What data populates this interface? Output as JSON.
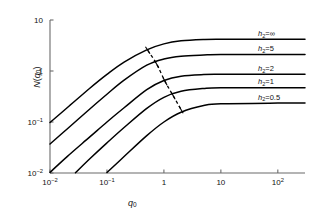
{
  "axes": {
    "x": {
      "label": "q0",
      "label_base": "q",
      "label_sub": "0",
      "ticks": [
        {
          "value": 0.01,
          "text_base": "10",
          "text_sup": "-2"
        },
        {
          "value": 0.1,
          "text_base": "10",
          "text_sup": "-1"
        },
        {
          "value": 1,
          "text_base": "1",
          "text_sup": ""
        },
        {
          "value": 10,
          "text_base": "10",
          "text_sup": ""
        },
        {
          "value": 100,
          "text_base": "10",
          "text_sup": "2"
        }
      ],
      "min": 0.01,
      "max": 300,
      "scale": "log"
    },
    "y": {
      "label_base": "N",
      "label_paren_open": "(",
      "label_q": "q",
      "label_sub": "0",
      "label_paren_close": ")",
      "ticks": [
        {
          "value": 0.01,
          "text_base": "10",
          "text_sup": "-2"
        },
        {
          "value": 0.1,
          "text_base": "10",
          "text_sup": "-1"
        },
        {
          "value": 1,
          "text_base": "1",
          "text_sup": ""
        },
        {
          "value": 10,
          "text_base": "10",
          "text_sup": ""
        }
      ],
      "min": 0.01,
      "max": 10,
      "scale": "log"
    }
  },
  "chart_data": {
    "type": "line",
    "title": "",
    "xlabel": "q0",
    "ylabel": "N(q0)",
    "xlim": [
      0.01,
      300
    ],
    "ylim": [
      0.01,
      10
    ],
    "xscale": "log",
    "yscale": "log",
    "grid": false,
    "legend_position": "inline-right",
    "annotation": {
      "name": "dashed-locus",
      "style": "dashed",
      "description": "dashed curve crossing the family of curves, with short tick marks at each crossing",
      "points": [
        {
          "x": 0.52,
          "y": 2.55
        },
        {
          "x": 0.75,
          "y": 1.35
        },
        {
          "x": 1.05,
          "y": 0.62
        },
        {
          "x": 1.45,
          "y": 0.33
        },
        {
          "x": 2.0,
          "y": 0.175
        }
      ]
    },
    "series": [
      {
        "name": "h2=inf",
        "label_base": "h",
        "label_sub": "2",
        "label_eq": "=",
        "label_value": "∞",
        "plateau": 4.2,
        "x_start": 0.01,
        "y_start": 0.098,
        "points": [
          {
            "x": 0.01,
            "y": 0.098
          },
          {
            "x": 0.02,
            "y": 0.19
          },
          {
            "x": 0.05,
            "y": 0.46
          },
          {
            "x": 0.1,
            "y": 0.86
          },
          {
            "x": 0.2,
            "y": 1.5
          },
          {
            "x": 0.5,
            "y": 2.6
          },
          {
            "x": 1,
            "y": 3.4
          },
          {
            "x": 2,
            "y": 3.9
          },
          {
            "x": 5,
            "y": 4.15
          },
          {
            "x": 10,
            "y": 4.2
          },
          {
            "x": 100,
            "y": 4.2
          },
          {
            "x": 300,
            "y": 4.2
          }
        ]
      },
      {
        "name": "h2=5",
        "label_base": "h",
        "label_sub": "2",
        "label_eq": "=",
        "label_value": "5",
        "plateau": 2.1,
        "x_start": 0.01,
        "y_start": 0.037,
        "points": [
          {
            "x": 0.01,
            "y": 0.037
          },
          {
            "x": 0.02,
            "y": 0.073
          },
          {
            "x": 0.05,
            "y": 0.18
          },
          {
            "x": 0.1,
            "y": 0.35
          },
          {
            "x": 0.2,
            "y": 0.66
          },
          {
            "x": 0.5,
            "y": 1.3
          },
          {
            "x": 1,
            "y": 1.72
          },
          {
            "x": 2,
            "y": 1.95
          },
          {
            "x": 5,
            "y": 2.06
          },
          {
            "x": 10,
            "y": 2.1
          },
          {
            "x": 100,
            "y": 2.1
          },
          {
            "x": 300,
            "y": 2.1
          }
        ]
      },
      {
        "name": "h2=2",
        "label_base": "h",
        "label_sub": "2",
        "label_eq": "=",
        "label_value": "2",
        "plateau": 0.86,
        "x_start": 0.01,
        "y_start": 0.0103,
        "points": [
          {
            "x": 0.01,
            "y": 0.0103
          },
          {
            "x": 0.02,
            "y": 0.021
          },
          {
            "x": 0.05,
            "y": 0.051
          },
          {
            "x": 0.1,
            "y": 0.1
          },
          {
            "x": 0.2,
            "y": 0.19
          },
          {
            "x": 0.5,
            "y": 0.43
          },
          {
            "x": 1,
            "y": 0.65
          },
          {
            "x": 2,
            "y": 0.79
          },
          {
            "x": 5,
            "y": 0.85
          },
          {
            "x": 10,
            "y": 0.86
          },
          {
            "x": 100,
            "y": 0.86
          },
          {
            "x": 300,
            "y": 0.86
          }
        ]
      },
      {
        "name": "h2=1",
        "label_base": "h",
        "label_sub": "2",
        "label_eq": "=",
        "label_value": "1",
        "plateau": 0.47,
        "x_start": 0.028,
        "y_start": 0.0101,
        "points": [
          {
            "x": 0.028,
            "y": 0.0101
          },
          {
            "x": 0.05,
            "y": 0.019
          },
          {
            "x": 0.1,
            "y": 0.039
          },
          {
            "x": 0.2,
            "y": 0.078
          },
          {
            "x": 0.5,
            "y": 0.185
          },
          {
            "x": 1,
            "y": 0.305
          },
          {
            "x": 2,
            "y": 0.4
          },
          {
            "x": 5,
            "y": 0.455
          },
          {
            "x": 10,
            "y": 0.47
          },
          {
            "x": 100,
            "y": 0.47
          },
          {
            "x": 300,
            "y": 0.47
          }
        ]
      },
      {
        "name": "h2=0.5",
        "label_base": "h",
        "label_sub": "2",
        "label_eq": "=",
        "label_value": "0.5",
        "plateau": 0.235,
        "x_start": 0.1,
        "y_start": 0.0102,
        "points": [
          {
            "x": 0.1,
            "y": 0.0102
          },
          {
            "x": 0.2,
            "y": 0.021
          },
          {
            "x": 0.5,
            "y": 0.054
          },
          {
            "x": 1,
            "y": 0.1
          },
          {
            "x": 2,
            "y": 0.155
          },
          {
            "x": 5,
            "y": 0.21
          },
          {
            "x": 10,
            "y": 0.228
          },
          {
            "x": 100,
            "y": 0.235
          },
          {
            "x": 300,
            "y": 0.235
          }
        ]
      }
    ]
  },
  "colors": {
    "curve": "#000000",
    "axis": "#6b6b6b",
    "text": "#111111",
    "background": "#ffffff"
  }
}
